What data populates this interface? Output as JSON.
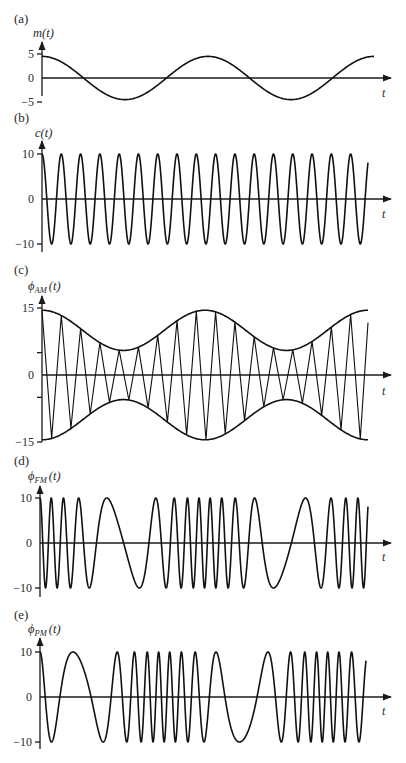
{
  "figure": {
    "panels": [
      {
        "id": "a",
        "panel_label": "(a)",
        "ylabel_main": "m",
        "ylabel_sub": "",
        "ylabel_arg": "(t)",
        "xlabel": "t",
        "ticks": [
          {
            "value": 5,
            "label": "5"
          },
          {
            "value": 0,
            "label": "0"
          },
          {
            "value": -5,
            "label": "−5"
          }
        ]
      },
      {
        "id": "b",
        "panel_label": "(b)",
        "ylabel_main": "c",
        "ylabel_sub": "",
        "ylabel_arg": "(t)",
        "xlabel": "t",
        "ticks": [
          {
            "value": 10,
            "label": "10"
          },
          {
            "value": 0,
            "label": "0"
          },
          {
            "value": -10,
            "label": "−10"
          }
        ]
      },
      {
        "id": "c",
        "panel_label": "(c)",
        "ylabel_main": "ϕ",
        "ylabel_sub": "AM",
        "ylabel_arg": "(t)",
        "xlabel": "t",
        "ticks": [
          {
            "value": 15,
            "label": "15"
          },
          {
            "value": 5,
            "label": ""
          },
          {
            "value": 0,
            "label": "0"
          },
          {
            "value": -5,
            "label": ""
          },
          {
            "value": -15,
            "label": "−15"
          }
        ]
      },
      {
        "id": "d",
        "panel_label": "(d)",
        "ylabel_main": "ϕ",
        "ylabel_sub": "FM",
        "ylabel_arg": "(t)",
        "xlabel": "t",
        "ticks": [
          {
            "value": 10,
            "label": "10"
          },
          {
            "value": 0,
            "label": "0"
          },
          {
            "value": -10,
            "label": "−10"
          }
        ]
      },
      {
        "id": "e",
        "panel_label": "(e)",
        "ylabel_main": "ϕ",
        "ylabel_sub": "PM",
        "ylabel_arg": "(t)",
        "xlabel": "t",
        "ticks": [
          {
            "value": 10,
            "label": "10"
          },
          {
            "value": 0,
            "label": "0"
          },
          {
            "value": -10,
            "label": "−10"
          }
        ]
      }
    ]
  },
  "chart_data": [
    {
      "type": "line",
      "panel": "(a)",
      "title": "",
      "xlabel": "t",
      "ylabel": "m(t)",
      "description": "Modulating (message) signal, sinusoid of amplitude ~4.5, ~2 periods, starting at a maximum",
      "function": "m(t) = 4.5 cos(2π t / T_m)",
      "amplitude": 4.5,
      "periods_shown": 2.0,
      "x": [
        0,
        0.125,
        0.25,
        0.375,
        0.5,
        0.625,
        0.75,
        0.875,
        1.0,
        1.125,
        1.25,
        1.375,
        1.5,
        1.625,
        1.75,
        1.875,
        2.0
      ],
      "values": [
        4.5,
        3.2,
        0,
        -3.2,
        -4.5,
        -3.2,
        0,
        3.2,
        4.5,
        3.2,
        0,
        -3.2,
        -4.5,
        -3.2,
        0,
        3.2,
        4.4
      ],
      "yticks": [
        5,
        0,
        -5
      ],
      "ylim": [
        -6,
        7
      ],
      "grid": false,
      "legend": null
    },
    {
      "type": "line",
      "panel": "(b)",
      "title": "",
      "xlabel": "t",
      "ylabel": "c(t)",
      "description": "Carrier signal, amplitude 10, ~17 cycles across the plot (about 8.4 carrier cycles per message period)",
      "function": "c(t) = 10 cos(2π f_c t)",
      "amplitude": 10,
      "cycles_shown": 16.9,
      "yticks": [
        10,
        0,
        -10
      ],
      "ylim": [
        -11,
        13
      ],
      "grid": false,
      "legend": null
    },
    {
      "type": "line",
      "panel": "(c)",
      "title": "",
      "xlabel": "t",
      "ylabel": "ϕ_AM(t)",
      "description": "AM signal [A + m(t)] c(t)/10 with envelope ±(10 + m(t)); envelope ranges 5.5 to 14.5",
      "function": "ϕ_AM(t) = [10 + m(t)] cos(2π f_c t)",
      "carrier_amplitude": 10,
      "envelope_max": 14.5,
      "envelope_min": 5.5,
      "cycles_shown": 16.9,
      "yticks": [
        15,
        5,
        0,
        -5,
        -15
      ],
      "ytick_labels": [
        "15",
        "",
        "0",
        "",
        "−15"
      ],
      "ylim": [
        -16,
        18
      ],
      "grid": false,
      "legend": null
    },
    {
      "type": "line",
      "panel": "(d)",
      "title": "",
      "xlabel": "t",
      "ylabel": "ϕ_FM(t)",
      "description": "FM signal, amplitude 10; instantaneous frequency highest where m(t) is maximum and lowest where m(t) is minimum",
      "function": "ϕ_FM(t) = 10 cos(2π f_c t + k_f ∫ m)",
      "amplitude": 10,
      "relative_freq_deviation": 0.75,
      "yticks": [
        10,
        0,
        -10
      ],
      "ylim": [
        -11,
        13
      ],
      "grid": false,
      "legend": null
    },
    {
      "type": "line",
      "panel": "(e)",
      "title": "",
      "xlabel": "t",
      "ylabel": "ϕ_PM(t)",
      "description": "PM signal, amplitude 10; instantaneous frequency highest where dm/dt is maximum (rising zero-crossings of m) and lowest at falling zero-crossings",
      "function": "ϕ_PM(t) = 10 cos(2π f_c t + k_p m(t))",
      "amplitude": 10,
      "relative_freq_deviation": 0.75,
      "yticks": [
        10,
        0,
        -10
      ],
      "ylim": [
        -11,
        13
      ],
      "grid": false,
      "legend": null
    }
  ]
}
